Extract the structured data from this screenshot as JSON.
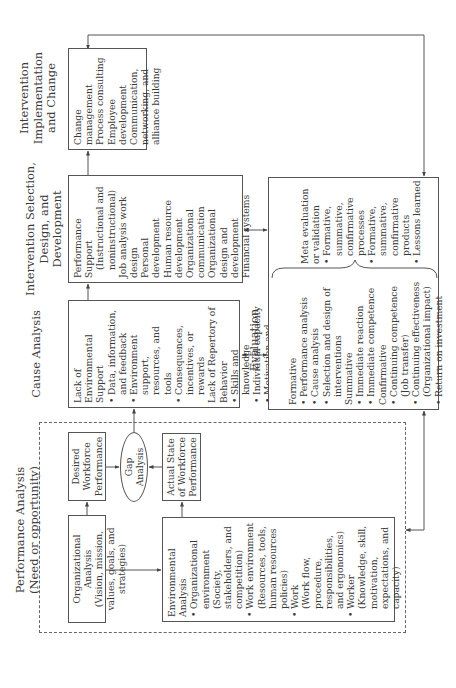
{
  "headers": {
    "performance_analysis": "Performance Analysis",
    "performance_analysis_sub": "(Need or opportunity)",
    "cause_analysis": "Cause Analysis",
    "intervention_selection_line1": "Intervention Selection,",
    "intervention_selection_line2": "Design, and Development",
    "intervention_implementation_line1": "Intervention",
    "intervention_implementation_line2": "Implementation",
    "intervention_implementation_line3": "and Change",
    "evaluation": "Evaluation"
  },
  "performance": {
    "organizational_analysis": {
      "title": "Organizational Analysis",
      "detail": "(Vision, mission, values, goals, and strategies)"
    },
    "desired": "Desired Workforce Performance",
    "gap": "Gap Analysis",
    "actual": "Actual State of Workforce Performance",
    "environmental_analysis": {
      "title": "Environmental Analysis",
      "items": [
        {
          "label": "Organizational environment",
          "detail": "(Society, stakeholders, and competition)"
        },
        {
          "label": "Work environment",
          "detail": "(Resources, tools, human resources policies)"
        },
        {
          "label": "Work",
          "detail": "(Work flow, procedure, responsibilities, and ergonomics)"
        },
        {
          "label": "Worker",
          "detail": "(Knowledge, skill, motivation, expectations, and capacity)"
        }
      ]
    }
  },
  "cause": {
    "group1_title": "Lack of Environmental Support",
    "group1_items": [
      "Data, information, and feedback",
      "Environment support, resources, and tools",
      "Consequences, incentives, or rewards"
    ],
    "group2_title": "Lack of Repertory of Behavior",
    "group2_items": [
      "Skills and knowledge",
      "Individual capacity",
      "Motivation and expectations"
    ]
  },
  "selection": {
    "items": [
      "Performance Support",
      "(Instructional and noninstructional)",
      "Job analysis work design",
      "Personal development",
      "Human resource development",
      "Organizational communication",
      "Organizational design and development",
      "Financial systems"
    ]
  },
  "implementation": {
    "items": [
      "Change management",
      "Process consulting",
      "Employee development",
      "Communication, networking, and alliance building"
    ]
  },
  "evaluation": {
    "formative_title": "Formative",
    "formative_items": [
      "Performance analysis",
      "Cause analysis",
      "Selection and design of interventions"
    ],
    "summative_title": "Summative",
    "summative_items": [
      "Immediate reaction",
      "Immediate competence"
    ],
    "confirmative_title": "Confirmative",
    "confirmative_items": [
      "Continuing competence (Job transfer)",
      "Continuing effectiveness (Organizational impact)",
      "Return on investment"
    ],
    "meta_title": "Meta evaluation or validation",
    "meta_items": [
      "Formative, summative, confirmative processes",
      "Formative, summative, confirmative products",
      "Lessons learned"
    ]
  },
  "colors": {
    "line": "#555555",
    "text": "#3a3a3a",
    "background": "#ffffff"
  }
}
